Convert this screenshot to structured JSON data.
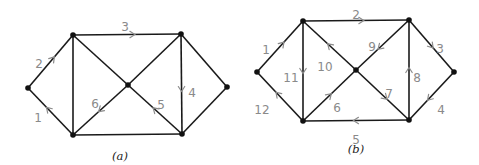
{
  "figures": [
    {
      "id": "a",
      "caption": "(a)",
      "vertices": [
        "L",
        "TL",
        "BL",
        "C",
        "TR",
        "BR",
        "R"
      ],
      "edges": [
        {
          "from": "L",
          "to": "TL",
          "label": "2",
          "directed": true
        },
        {
          "from": "BL",
          "to": "L",
          "label": "1",
          "directed": true
        },
        {
          "from": "TL",
          "to": "TR",
          "label": "3",
          "directed": true
        },
        {
          "from": "TR",
          "to": "BR",
          "label": "4",
          "directed": true
        },
        {
          "from": "BR",
          "to": "C",
          "label": "5",
          "directed": true
        },
        {
          "from": "C",
          "to": "BL",
          "label": "6",
          "directed": true
        },
        {
          "from": "TL",
          "to": "BL",
          "label": "",
          "directed": false
        },
        {
          "from": "TL",
          "to": "C",
          "label": "",
          "directed": false
        },
        {
          "from": "C",
          "to": "TR",
          "label": "",
          "directed": false
        },
        {
          "from": "BL",
          "to": "BR",
          "label": "",
          "directed": false
        },
        {
          "from": "TR",
          "to": "R",
          "label": "",
          "directed": false
        },
        {
          "from": "R",
          "to": "BR",
          "label": "",
          "directed": false
        }
      ]
    },
    {
      "id": "b",
      "caption": "(b)",
      "vertices": [
        "L",
        "TL",
        "BL",
        "C",
        "TR",
        "BR",
        "R"
      ],
      "edges": [
        {
          "from": "L",
          "to": "TL",
          "label": "1",
          "directed": true
        },
        {
          "from": "TL",
          "to": "TR",
          "label": "2",
          "directed": true
        },
        {
          "from": "TR",
          "to": "R",
          "label": "3",
          "directed": true
        },
        {
          "from": "R",
          "to": "BR",
          "label": "4",
          "directed": true
        },
        {
          "from": "BR",
          "to": "BL",
          "label": "5",
          "directed": true
        },
        {
          "from": "BL",
          "to": "C",
          "label": "6",
          "directed": true
        },
        {
          "from": "C",
          "to": "BR",
          "label": "7",
          "directed": true
        },
        {
          "from": "BR",
          "to": "TR",
          "label": "8",
          "directed": true
        },
        {
          "from": "TR",
          "to": "C",
          "label": "9",
          "directed": true
        },
        {
          "from": "C",
          "to": "TL",
          "label": "10",
          "directed": true
        },
        {
          "from": "TL",
          "to": "BL",
          "label": "11",
          "directed": true
        },
        {
          "from": "BL",
          "to": "L",
          "label": "12",
          "directed": true
        }
      ]
    }
  ]
}
